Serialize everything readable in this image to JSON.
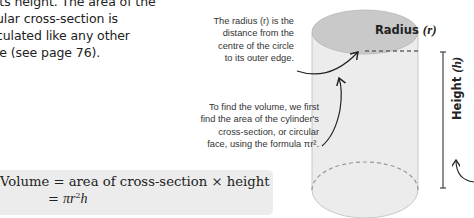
{
  "intro_text": {
    "lines": [
      "its height. The area of the",
      "ular cross-section is",
      "culated like any other",
      "le (see page 76)."
    ]
  },
  "annotations": {
    "radius": {
      "lines": [
        "The radius (r) is the",
        "distance from the",
        "centre of the circle",
        "to its outer edge."
      ]
    },
    "volume": {
      "lines": [
        "To find the volume, we first",
        "find the area of the cylinder's",
        "cross-section, or circular",
        "face, using the formula πr²."
      ]
    }
  },
  "labels": {
    "radius": "Radius",
    "radius_symbol": "(r)",
    "height": "Height",
    "height_symbol": "(h)"
  },
  "formula": {
    "line1": "Volume = area of cross-section × height",
    "line2_prefix": "= ",
    "line2_pi_r": "πr",
    "line2_exp": "2",
    "line2_h": "h"
  },
  "colors": {
    "top_face": "#c9c9c9",
    "body": "#ebebeb",
    "formula_box": "#ececec",
    "text": "#222222"
  }
}
